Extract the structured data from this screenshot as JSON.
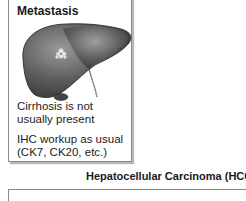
{
  "metastasis_panel": {
    "title": "Metastasis",
    "illustration": "liver-with-metastatic-lesion-icon",
    "notes": [
      "Cirrhosis is not usually present",
      "IHC workup as usual (CK7, CK20, etc.)"
    ]
  },
  "hcc_panel": {
    "title": "Hepatocellular Carcinoma (HCC)"
  }
}
